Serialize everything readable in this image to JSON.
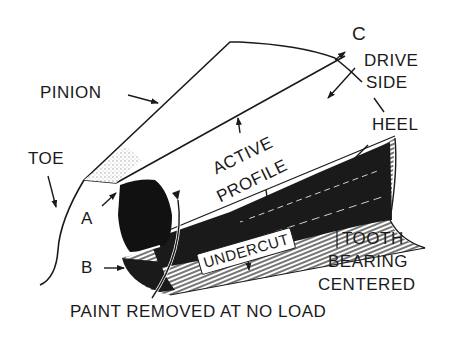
{
  "figure": {
    "type": "technical-illustration",
    "colors": {
      "ink": "#1a1a1a",
      "background": "#ffffff",
      "shading": "#cfcfcf"
    }
  },
  "labels": {
    "pinion": "PINION",
    "toe": "TOE",
    "c": "C",
    "drive_side_line1": "DRIVE",
    "drive_side_line2": "SIDE",
    "heel": "HEEL",
    "active_profile_line1": "ACTIVE",
    "active_profile_line2": "PROFILE",
    "a": "A",
    "b": "B",
    "undercut": "UNDERCUT",
    "tooth_bearing_line1": "TOOTH",
    "tooth_bearing_line2": "BEARING",
    "tooth_bearing_line3": "CENTERED",
    "caption": "PAINT REMOVED AT NO LOAD"
  }
}
